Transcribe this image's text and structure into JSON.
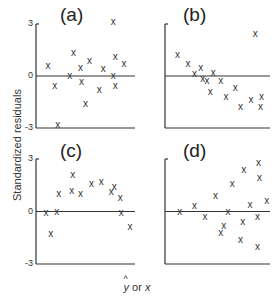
{
  "figure": {
    "ylabel": "Standardized residuals",
    "xlabel_hat": "y",
    "xlabel_or": "or",
    "xlabel_x": "x",
    "ticks": [
      "3",
      "0",
      "-3"
    ]
  },
  "chart_data": [
    {
      "type": "scatter",
      "title": "(a)",
      "xlabel": "ŷ or x",
      "ylabel": "Standardized residuals",
      "ylim": [
        -3,
        3
      ],
      "yticks": [
        3,
        0,
        -3
      ],
      "grid": false,
      "marker": "x",
      "reference_line_y": 0,
      "points": [
        [
          0.12,
          0.6
        ],
        [
          0.19,
          -0.6
        ],
        [
          0.22,
          -2.8
        ],
        [
          0.34,
          0
        ],
        [
          0.38,
          1.3
        ],
        [
          0.45,
          0.45
        ],
        [
          0.46,
          -0.35
        ],
        [
          0.5,
          -1.6
        ],
        [
          0.54,
          0.85
        ],
        [
          0.64,
          -0.8
        ],
        [
          0.68,
          0.4
        ],
        [
          0.78,
          3.1
        ],
        [
          0.78,
          0
        ],
        [
          0.8,
          1.1
        ],
        [
          0.8,
          -0.6
        ],
        [
          0.89,
          0.7
        ]
      ]
    },
    {
      "type": "scatter",
      "title": "(b)",
      "xlabel": "ŷ or x",
      "ylabel": "Standardized residuals",
      "ylim": [
        -3,
        3
      ],
      "grid": false,
      "marker": "x",
      "reference_line_y": 0,
      "points": [
        [
          0.12,
          1.2
        ],
        [
          0.22,
          0.7
        ],
        [
          0.28,
          0.1
        ],
        [
          0.34,
          0.45
        ],
        [
          0.36,
          -0.15
        ],
        [
          0.4,
          -0.3
        ],
        [
          0.43,
          -0.9
        ],
        [
          0.46,
          0.15
        ],
        [
          0.53,
          -0.3
        ],
        [
          0.58,
          -1.2
        ],
        [
          0.67,
          -0.7
        ],
        [
          0.72,
          -1.8
        ],
        [
          0.82,
          -1.4
        ],
        [
          0.86,
          2.4
        ],
        [
          0.91,
          -1.8
        ],
        [
          0.92,
          -1.2
        ]
      ]
    },
    {
      "type": "scatter",
      "title": "(c)",
      "xlabel": "ŷ or x",
      "ylabel": "Standardized residuals",
      "ylim": [
        -3,
        3
      ],
      "yticks": [
        3,
        0,
        -3
      ],
      "grid": false,
      "marker": "x",
      "reference_line_y": 0,
      "points": [
        [
          0.1,
          -0.1
        ],
        [
          0.15,
          -1.3
        ],
        [
          0.21,
          0
        ],
        [
          0.23,
          1
        ],
        [
          0.36,
          1.2
        ],
        [
          0.37,
          2.1
        ],
        [
          0.45,
          1
        ],
        [
          0.56,
          1.6
        ],
        [
          0.66,
          1.7
        ],
        [
          0.76,
          1.1
        ],
        [
          0.79,
          1.4
        ],
        [
          0.85,
          0.8
        ],
        [
          0.86,
          -0.1
        ],
        [
          0.95,
          -0.9
        ]
      ]
    },
    {
      "type": "scatter",
      "title": "(d)",
      "xlabel": "ŷ or x",
      "ylabel": "Standardized residuals",
      "ylim": [
        -3,
        3
      ],
      "grid": false,
      "marker": "x",
      "reference_line_y": 0,
      "points": [
        [
          0.14,
          0
        ],
        [
          0.28,
          0.3
        ],
        [
          0.38,
          -0.3
        ],
        [
          0.48,
          0.9
        ],
        [
          0.53,
          -1.2
        ],
        [
          0.56,
          -0.8
        ],
        [
          0.6,
          0
        ],
        [
          0.64,
          1.6
        ],
        [
          0.72,
          -1.6
        ],
        [
          0.74,
          -0.6
        ],
        [
          0.75,
          2.4
        ],
        [
          0.81,
          0.4
        ],
        [
          0.88,
          -2
        ],
        [
          0.88,
          -0.3
        ],
        [
          0.89,
          2.8
        ],
        [
          0.9,
          1.9
        ],
        [
          0.97,
          0.6
        ]
      ]
    }
  ]
}
